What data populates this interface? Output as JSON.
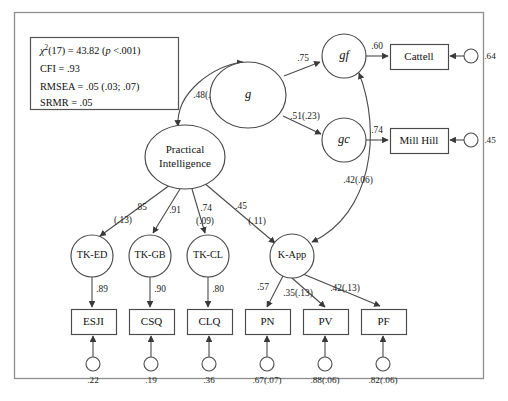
{
  "figure": {
    "type": "path-diagram"
  },
  "fit_statistics": {
    "chi_square_symbol": "χ",
    "chi_square_superscript": "2",
    "chi_square_line_rest": "(17) = 43.82 (",
    "chi_square_p_italic": "p",
    "chi_square_line_tail": " <.001)",
    "cfi": "CFI = .93",
    "rmsea": "RMSEA = .05 (.03; .07)",
    "srmr": "SRMR = .05"
  },
  "latent_nodes": [
    {
      "id": "g",
      "label": "g",
      "shape": "ellipse",
      "italic": true,
      "cx": 248,
      "cy": 95,
      "rx": 38,
      "ry": 33
    },
    {
      "id": "gf",
      "label": "gf",
      "shape": "circle",
      "italic": true,
      "cx": 344,
      "cy": 56,
      "rx": 22,
      "ry": 22
    },
    {
      "id": "gc",
      "label": "gc",
      "shape": "circle",
      "italic": true,
      "cx": 344,
      "cy": 140,
      "rx": 22,
      "ry": 22
    },
    {
      "id": "practical",
      "label": "Practical Intelligence",
      "shape": "ellipse",
      "italic": false,
      "cx": 185,
      "cy": 157,
      "rx": 40,
      "ry": 32
    },
    {
      "id": "tked",
      "label": "TK-ED",
      "shape": "circle",
      "italic": false,
      "cx": 92,
      "cy": 256,
      "rx": 21,
      "ry": 21
    },
    {
      "id": "tkgb",
      "label": "TK-GB",
      "shape": "circle",
      "italic": false,
      "cx": 150,
      "cy": 256,
      "rx": 21,
      "ry": 21
    },
    {
      "id": "tkcl",
      "label": "TK-CL",
      "shape": "circle",
      "italic": false,
      "cx": 208,
      "cy": 256,
      "rx": 21,
      "ry": 21
    },
    {
      "id": "kapp",
      "label": "K-App",
      "shape": "circle",
      "italic": false,
      "cx": 292,
      "cy": 256,
      "rx": 22,
      "ry": 22
    }
  ],
  "observed_nodes": [
    {
      "id": "cattell",
      "label": "Cattell",
      "x": 390,
      "y": 44,
      "w": 58,
      "h": 25
    },
    {
      "id": "millhill",
      "label": "Mill Hill",
      "x": 390,
      "y": 128,
      "w": 58,
      "h": 25
    },
    {
      "id": "esji",
      "label": "ESJI",
      "x": 71,
      "y": 309,
      "w": 45,
      "h": 25
    },
    {
      "id": "csq",
      "label": "CSQ",
      "x": 129,
      "y": 309,
      "w": 45,
      "h": 25
    },
    {
      "id": "clq",
      "label": "CLQ",
      "x": 187,
      "y": 309,
      "w": 45,
      "h": 25
    },
    {
      "id": "pn",
      "label": "PN",
      "x": 245,
      "y": 309,
      "w": 45,
      "h": 25
    },
    {
      "id": "pv",
      "label": "PV",
      "x": 303,
      "y": 309,
      "w": 45,
      "h": 25
    },
    {
      "id": "pf",
      "label": "PF",
      "x": 361,
      "y": 309,
      "w": 45,
      "h": 25
    }
  ],
  "error_terms": [
    {
      "id": "e-cattell",
      "value": ".64",
      "cx": 471,
      "cy": 56,
      "r": 7,
      "label_x": 490,
      "label_y": 57,
      "to": "cattell",
      "dir": "left"
    },
    {
      "id": "e-millhill",
      "value": ".45",
      "cx": 471,
      "cy": 140,
      "r": 7,
      "label_x": 490,
      "label_y": 141,
      "to": "millhill",
      "dir": "left"
    },
    {
      "id": "e-esji",
      "value": ".22",
      "cx": 93,
      "cy": 364,
      "r": 7,
      "label_x": 93,
      "label_y": 381,
      "to": "esji",
      "dir": "up"
    },
    {
      "id": "e-csq",
      "value": ".19",
      "cx": 151,
      "cy": 364,
      "r": 7,
      "label_x": 151,
      "label_y": 381,
      "to": "csq",
      "dir": "up"
    },
    {
      "id": "e-clq",
      "value": ".36",
      "cx": 209,
      "cy": 364,
      "r": 7,
      "label_x": 209,
      "label_y": 381,
      "to": "clq",
      "dir": "up"
    },
    {
      "id": "e-pn",
      "value": ".67(.07)",
      "cx": 267,
      "cy": 364,
      "r": 7,
      "label_x": 267,
      "label_y": 381,
      "to": "pn",
      "dir": "up"
    },
    {
      "id": "e-pv",
      "value": ".88(.06)",
      "cx": 325,
      "cy": 364,
      "r": 7,
      "label_x": 325,
      "label_y": 381,
      "to": "pv",
      "dir": "up"
    },
    {
      "id": "e-pf",
      "value": ".82(.06)",
      "cx": 383,
      "cy": 364,
      "r": 7,
      "label_x": 383,
      "label_y": 381,
      "to": "pf",
      "dir": "up"
    }
  ],
  "paths": [
    {
      "id": "g-to-gf",
      "from": "g",
      "to": "gf",
      "coef": ".75",
      "d": "M 284,76 L 320,62",
      "label_x": 303,
      "label_y": 59,
      "arrow": "end"
    },
    {
      "id": "g-to-gc",
      "from": "g",
      "to": "gc",
      "coef": ".51(.23)",
      "d": "M 283,116 L 321,134",
      "label_x": 305,
      "label_y": 117,
      "arrow": "end"
    },
    {
      "id": "gf-to-cattell",
      "from": "gf",
      "to": "cattell",
      "coef": ".60",
      "d": "M 366,56 L 388,56",
      "label_x": 377,
      "label_y": 47,
      "arrow": "end"
    },
    {
      "id": "gc-to-millhill",
      "from": "gc",
      "to": "millhill",
      "coef": ".74",
      "d": "M 366,140 L 388,140",
      "label_x": 377,
      "label_y": 131,
      "arrow": "end"
    },
    {
      "id": "g-with-pi",
      "from": "g",
      "to": "practical",
      "coef": ".48(.03)",
      "d": "M 178,126 C 176,92 213,66 243,62",
      "label_x": 208,
      "label_y": 96,
      "arrow": "both"
    },
    {
      "id": "gf-with-kapp",
      "from": "kapp",
      "to": "gf",
      "coef": ".42(.06)",
      "d": "M 312,242 C 372,214 382,132 359,73",
      "label_x": 358,
      "label_y": 181,
      "arrow": "both"
    },
    {
      "id": "pi-to-tked",
      "from": "practical",
      "to": "tked",
      "coef": ".85",
      "coef2": "(.13)",
      "d": "M 170,185 L 100,236",
      "label_x": 141,
      "label_y": 208,
      "label2_x": 123,
      "label2_y": 221,
      "arrow": "end"
    },
    {
      "id": "pi-to-tkgb",
      "from": "practical",
      "to": "tkgb",
      "coef": ".91",
      "coef2": "",
      "d": "M 180,189 L 153,233",
      "label_x": 175,
      "label_y": 211,
      "label2_x": 0,
      "label2_y": 0,
      "arrow": "end"
    },
    {
      "id": "pi-to-tkcl",
      "from": "practical",
      "to": "tkcl",
      "coef": ".74",
      "coef2": "(.09)",
      "d": "M 192,189 L 205,233",
      "label_x": 206,
      "label_y": 209,
      "label2_x": 205,
      "label2_y": 222,
      "arrow": "end"
    },
    {
      "id": "pi-to-kapp",
      "from": "practical",
      "to": "kapp",
      "coef": ".45",
      "coef2": "(.11)",
      "d": "M 203,182 L 275,243",
      "label_x": 241,
      "label_y": 207,
      "label2_x": 257,
      "label2_y": 222,
      "arrow": "end"
    },
    {
      "id": "tked-to-esji",
      "from": "tked",
      "to": "esji",
      "coef": ".89",
      "d": "M 92,277 L 92,307",
      "label_x": 102,
      "label_y": 290,
      "arrow": "end"
    },
    {
      "id": "tkgb-to-csq",
      "from": "tkgb",
      "to": "csq",
      "coef": ".90",
      "d": "M 150,277 L 150,307",
      "label_x": 160,
      "label_y": 290,
      "arrow": "end"
    },
    {
      "id": "tkcl-to-clq",
      "from": "tkcl",
      "to": "clq",
      "coef": ".80",
      "d": "M 208,277 L 208,307",
      "label_x": 218,
      "label_y": 290,
      "arrow": "end"
    },
    {
      "id": "kapp-to-pn",
      "from": "kapp",
      "to": "pn",
      "coef": ".57",
      "d": "M 283,276 L 267,307",
      "label_x": 263,
      "label_y": 288,
      "arrow": "end"
    },
    {
      "id": "kapp-to-pv",
      "from": "kapp",
      "to": "pv",
      "coef": ".35(.13)",
      "d": "M 292,278 L 325,307",
      "label_x": 298,
      "label_y": 294,
      "arrow": "end"
    },
    {
      "id": "kapp-to-pf",
      "from": "kapp",
      "to": "pf",
      "coef": ".42(.13)",
      "d": "M 303,274 L 380,306",
      "label_x": 345,
      "label_y": 289,
      "arrow": "end"
    }
  ]
}
